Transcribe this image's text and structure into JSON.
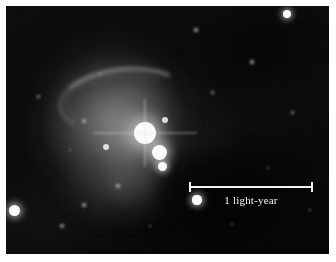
{
  "figure": {
    "kind": "astronomical-photograph",
    "plate_background_color": "#050505",
    "page_background_color": "#ffffff",
    "margin_px": 6
  },
  "scalebar": {
    "label": "1 light-year",
    "color": "#f2f2f2",
    "length_px": 124,
    "left_px": 189,
    "top_px": 182,
    "tick_height_px": 10,
    "endpoints": [
      "left-tick",
      "right-tick"
    ]
  },
  "nebula": {
    "label": "diffuse reflection nebulosity",
    "arc_label": "bright curved filament",
    "core_color": "#b8b8b8",
    "halo_color": "#6e6e6e"
  },
  "stars": [
    {
      "name": "cluster-core-star",
      "x": 145,
      "y": 133,
      "r": 11,
      "brightness": "very-bright",
      "glow": true,
      "blur": "soft"
    },
    {
      "name": "cluster-second-star",
      "x": 159,
      "y": 152,
      "r": 7.5,
      "brightness": "bright",
      "glow": true,
      "blur": "soft"
    },
    {
      "name": "cluster-third-star",
      "x": 162,
      "y": 166,
      "r": 4.5,
      "brightness": "bright",
      "glow": true,
      "blur": "soft"
    },
    {
      "name": "cluster-north-star",
      "x": 165,
      "y": 120,
      "r": 3.2,
      "brightness": "medium",
      "glow": false,
      "blur": "soft"
    },
    {
      "name": "field-star-upper-right",
      "x": 287,
      "y": 14,
      "r": 4.2,
      "brightness": "bright",
      "glow": true,
      "blur": "soft"
    },
    {
      "name": "field-star-lower-left",
      "x": 14,
      "y": 210,
      "r": 5.5,
      "brightness": "bright",
      "glow": true,
      "blur": "soft"
    },
    {
      "name": "field-star-near-bar",
      "x": 197,
      "y": 200,
      "r": 4.6,
      "brightness": "bright",
      "glow": true,
      "blur": "soft"
    },
    {
      "name": "field-star-mid-left",
      "x": 106,
      "y": 147,
      "r": 3.4,
      "brightness": "medium",
      "glow": false,
      "blur": "soft"
    },
    {
      "name": "field-star-faint-a",
      "x": 84,
      "y": 121,
      "r": 2.2,
      "brightness": "faint",
      "glow": false,
      "blur": "vsoft"
    },
    {
      "name": "field-star-faint-b",
      "x": 62,
      "y": 226,
      "r": 2.4,
      "brightness": "faint",
      "glow": false,
      "blur": "vsoft"
    },
    {
      "name": "field-star-faint-c",
      "x": 84,
      "y": 205,
      "r": 1.8,
      "brightness": "faint",
      "glow": false,
      "blur": "vsoft"
    },
    {
      "name": "field-star-faint-d",
      "x": 196,
      "y": 30,
      "r": 1.7,
      "brightness": "faint",
      "glow": false,
      "blur": "vsoft"
    },
    {
      "name": "field-star-faint-e",
      "x": 252,
      "y": 62,
      "r": 1.6,
      "brightness": "faint",
      "glow": false,
      "blur": "vsoft"
    },
    {
      "name": "field-star-faint-f",
      "x": 292,
      "y": 112,
      "r": 1.5,
      "brightness": "faint",
      "glow": false,
      "blur": "vsoft"
    },
    {
      "name": "field-star-faint-g",
      "x": 118,
      "y": 186,
      "r": 1.6,
      "brightness": "faint",
      "glow": false,
      "blur": "vsoft"
    },
    {
      "name": "field-star-faint-h",
      "x": 38,
      "y": 96,
      "r": 1.5,
      "brightness": "faint",
      "glow": false,
      "blur": "vsoft"
    },
    {
      "name": "field-star-faint-i",
      "x": 212,
      "y": 92,
      "r": 1.5,
      "brightness": "faint",
      "glow": false,
      "blur": "vsoft"
    },
    {
      "name": "field-star-faint-j",
      "x": 268,
      "y": 168,
      "r": 1.4,
      "brightness": "faint",
      "glow": false,
      "blur": "vsoft"
    },
    {
      "name": "field-star-faint-k",
      "x": 150,
      "y": 226,
      "r": 1.4,
      "brightness": "faint",
      "glow": false,
      "blur": "vsoft"
    },
    {
      "name": "field-star-faint-l",
      "x": 70,
      "y": 150,
      "r": 1.4,
      "brightness": "faint",
      "glow": false,
      "blur": "vsoft"
    },
    {
      "name": "field-star-faint-m",
      "x": 232,
      "y": 224,
      "r": 1.3,
      "brightness": "faint",
      "glow": false,
      "blur": "vsoft"
    },
    {
      "name": "field-star-faint-n",
      "x": 100,
      "y": 74,
      "r": 1.3,
      "brightness": "faint",
      "glow": false,
      "blur": "vsoft"
    },
    {
      "name": "field-star-faint-o",
      "x": 310,
      "y": 210,
      "r": 1.3,
      "brightness": "faint",
      "glow": false,
      "blur": "vsoft"
    }
  ]
}
